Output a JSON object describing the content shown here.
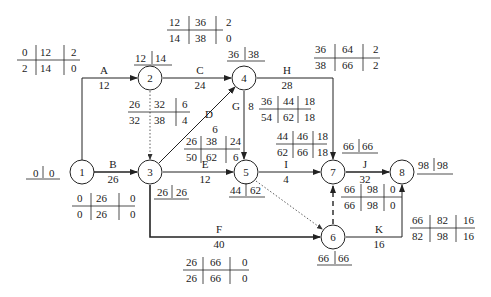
{
  "diagram": {
    "type": "activity-on-arrow network (six-time-parameter)",
    "nodes": [
      {
        "id": "1",
        "label": "1",
        "et": "0",
        "lt": "0"
      },
      {
        "id": "2",
        "label": "2",
        "et": "12",
        "lt": "14"
      },
      {
        "id": "3",
        "label": "3",
        "et": "26",
        "lt": "26"
      },
      {
        "id": "4",
        "label": "4",
        "et": "36",
        "lt": "38"
      },
      {
        "id": "5",
        "label": "5",
        "et": "44",
        "lt": "62"
      },
      {
        "id": "6",
        "label": "6",
        "et": "66",
        "lt": "66"
      },
      {
        "id": "7",
        "label": "7",
        "et": "66",
        "lt": "66"
      },
      {
        "id": "8",
        "label": "8",
        "et": "98",
        "lt": "98"
      }
    ],
    "activities": [
      {
        "name": "A",
        "duration": "12",
        "from": "1",
        "to": "2",
        "es": "0",
        "ef": "12",
        "tf": "2",
        "ls": "2",
        "lf": "14",
        "ff": "0"
      },
      {
        "name": "B",
        "duration": "26",
        "from": "1",
        "to": "3",
        "es": "0",
        "ef": "26",
        "tf": "0",
        "ls": "0",
        "lf": "26",
        "ff": "0"
      },
      {
        "name": "C",
        "duration": "24",
        "from": "2",
        "to": "4",
        "es": "12",
        "ef": "36",
        "tf": "2",
        "ls": "14",
        "lf": "38",
        "ff": "0"
      },
      {
        "name": "D",
        "duration": "6",
        "from": "3",
        "to": "4",
        "es": "26",
        "ef": "32",
        "tf": "6",
        "ls": "32",
        "lf": "38",
        "ff": "4"
      },
      {
        "name": "E",
        "duration": "12",
        "from": "3",
        "to": "5",
        "es": "26",
        "ef": "38",
        "tf": "24",
        "ls": "50",
        "lf": "62",
        "ff": "6"
      },
      {
        "name": "F",
        "duration": "40",
        "from": "3",
        "to": "6",
        "es": "26",
        "ef": "66",
        "tf": "0",
        "ls": "26",
        "lf": "66",
        "ff": "0"
      },
      {
        "name": "G",
        "duration": "8",
        "from": "4",
        "to": "5",
        "es": "36",
        "ef": "44",
        "tf": "18",
        "ls": "54",
        "lf": "62",
        "ff": "18"
      },
      {
        "name": "H",
        "duration": "28",
        "from": "4",
        "to": "7",
        "es": "36",
        "ef": "64",
        "tf": "2",
        "ls": "38",
        "lf": "66",
        "ff": "2"
      },
      {
        "name": "I",
        "duration": "4",
        "from": "5",
        "to": "7",
        "es": "44",
        "ef": "46",
        "tf": "18",
        "ls": "62",
        "lf": "66",
        "ff": "18"
      },
      {
        "name": "J",
        "duration": "32",
        "from": "7",
        "to": "8",
        "es": "66",
        "ef": "98",
        "tf": "0",
        "ls": "66",
        "lf": "98",
        "ff": "0"
      },
      {
        "name": "K",
        "duration": "16",
        "from": "6",
        "to": "8",
        "es": "66",
        "ef": "82",
        "tf": "16",
        "ls": "82",
        "lf": "98",
        "ff": "16"
      }
    ],
    "dummies": [
      {
        "from": "2",
        "to": "3",
        "style": "dotted"
      },
      {
        "from": "5",
        "to": "6",
        "style": "dotted"
      },
      {
        "from": "6",
        "to": "7",
        "style": "dashed"
      }
    ]
  }
}
